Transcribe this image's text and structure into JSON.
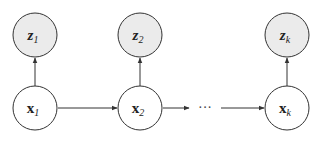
{
  "diagram": {
    "type": "graphical-model",
    "colors": {
      "observed_fill": "#ebebeb",
      "latent_fill": "#ffffff",
      "stroke": "#333333"
    },
    "nodes": [
      {
        "id": "z1",
        "base": "z",
        "sub": "1",
        "kind": "observed",
        "cx": 35,
        "cy": 35
      },
      {
        "id": "z2",
        "base": "z",
        "sub": "2",
        "kind": "observed",
        "cx": 140,
        "cy": 35
      },
      {
        "id": "zk",
        "base": "z",
        "sub": "k",
        "kind": "observed",
        "cx": 287,
        "cy": 35
      },
      {
        "id": "x1",
        "base": "x",
        "sub": "1",
        "kind": "latent",
        "cx": 35,
        "cy": 108
      },
      {
        "id": "x2",
        "base": "x",
        "sub": "2",
        "kind": "latent",
        "cx": 140,
        "cy": 108
      },
      {
        "id": "xk",
        "base": "x",
        "sub": "k",
        "kind": "latent",
        "cx": 287,
        "cy": 108
      }
    ],
    "edges": [
      {
        "from": "x1",
        "to": "z1"
      },
      {
        "from": "x2",
        "to": "z2"
      },
      {
        "from": "xk",
        "to": "zk"
      },
      {
        "from": "x1",
        "to": "x2"
      },
      {
        "from": "x2",
        "to": "ellipsis"
      },
      {
        "from": "ellipsis",
        "to": "xk"
      }
    ],
    "ellipsis": "···",
    "labels": {
      "z1": {
        "base": "z",
        "sub": "1"
      },
      "z2": {
        "base": "z",
        "sub": "2"
      },
      "zk": {
        "base": "z",
        "sub": "k"
      },
      "x1": {
        "base": "x",
        "sub": "1"
      },
      "x2": {
        "base": "x",
        "sub": "2"
      },
      "xk": {
        "base": "x",
        "sub": "k"
      }
    }
  }
}
